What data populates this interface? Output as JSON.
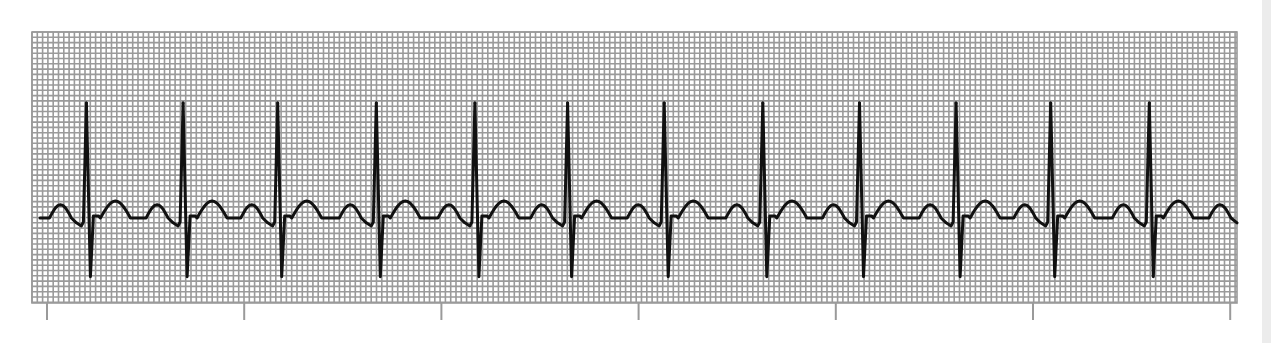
{
  "chart_data": {
    "type": "line",
    "title": "",
    "subtitle": "",
    "xlabel": "",
    "ylabel": "",
    "grid": true,
    "grid_units": "small boxes",
    "legend": "none",
    "x_units": "tick intervals (unlabeled tick marks below the strip)",
    "y_units": "small grid boxes relative to isoelectric baseline",
    "xlim": [
      -0.07,
      6.03
    ],
    "ylim": [
      -15.5,
      34.7
    ],
    "tick_marks": [
      0,
      1,
      2,
      3,
      4,
      5,
      6
    ],
    "tick_labels": [
      "",
      "",
      "",
      "",
      "",
      "",
      ""
    ],
    "beat_count": 12,
    "r_peak_times": [
      0.2,
      0.69,
      1.17,
      1.67,
      2.17,
      2.64,
      3.13,
      3.63,
      4.12,
      4.61,
      5.09,
      5.59
    ],
    "rr_interval_ticks": 0.49,
    "wave_amplitudes": {
      "P": 2.5,
      "Q": -1.5,
      "R": 21.7,
      "S": -11.1,
      "T": 3.2
    },
    "trace_start": 0.0,
    "trace_end": 6.03,
    "series": [
      {
        "name": "ECG lead",
        "color": "#111111"
      }
    ]
  },
  "colors": {
    "paper": "#ffffff",
    "grid_line": "#9a9a9a",
    "trace": "#111111",
    "tick": "#9a9a9a",
    "side_strip": "#ececec"
  }
}
